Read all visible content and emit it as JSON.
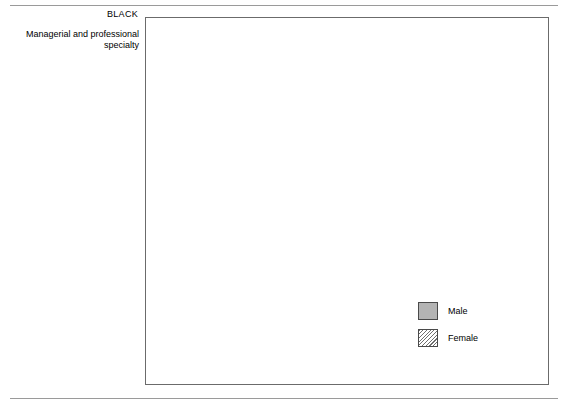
{
  "chart_data": {
    "type": "bar",
    "title": "",
    "xlabel": "",
    "ylabel": "",
    "orientation": "horizontal",
    "xlim": [
      0,
      48
    ],
    "grid": false,
    "legend_position": "middle-right",
    "legend": [
      "Male",
      "Female"
    ],
    "groups": [
      {
        "name": "BLACK",
        "categories": [
          "Managerial and professional\nspecialty",
          "Technical, sales, and admini-\nstrative support",
          "Service",
          "Precision production,\ncraft, and repair",
          "Operators, fabricators,\nand laborers",
          "Farming, forestry, and fishing"
        ],
        "series": [
          {
            "name": "Male",
            "values": [
              13.4,
              16.6,
              17.5,
              16.3,
              33.4,
              2.8
            ]
          },
          {
            "name": "Female",
            "values": [
              18.8,
              39.7,
              27.0,
              2.3,
              12.0,
              0.3
            ]
          }
        ]
      },
      {
        "name": "WHITE",
        "categories": [
          "Managerial and professional\nspecialty",
          "Technical, sales, and admini-\nstrative support",
          "Service",
          "Precision production,\ncraft, and repair",
          "Operators, fabricators,\nand laborers",
          "Farming, forestry, and fishing"
        ],
        "series": [
          {
            "name": "Male",
            "values": [
              27.3,
              20.8,
              8.7,
              19.9,
              19.2,
              4.1
            ]
          },
          {
            "name": "Female",
            "values": [
              27.4,
              45.7,
              16.1,
              2.1,
              7.6,
              1.1
            ]
          }
        ]
      }
    ]
  },
  "legend": {
    "male_label": "Male",
    "female_label": "Female"
  },
  "colors": {
    "male_fill": "#b4b4b4",
    "female_fill": "#e8e8e8",
    "bar_border": "#4a4a4a",
    "frame": "#6b6b6b",
    "rule": "#9a9a9a"
  },
  "layout": {
    "plot_left_px": 145,
    "plot_top_px": 17,
    "plot_width_px": 404,
    "plot_height_px": 368,
    "px_per_unit": 8.08,
    "bar_height_px": 9,
    "group_tops_px": [
      28,
      228
    ],
    "row_pitch_px": 28.5
  }
}
